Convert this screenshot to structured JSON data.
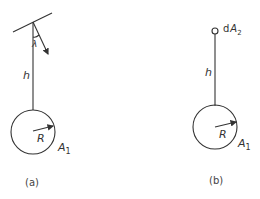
{
  "figure": {
    "panel_a": {
      "caption": "(a)",
      "height_label": "h",
      "angle_label": "λ",
      "radius_label": "R",
      "area_label": "A",
      "area_subscript": "1"
    },
    "panel_b": {
      "caption": "(b)",
      "height_label": "h",
      "radius_label": "R",
      "area_label": "A",
      "area_subscript": "1",
      "element_label_prefix": "d",
      "element_label": "A",
      "element_subscript": "2"
    }
  },
  "colors": {
    "line": "#333333",
    "background": "#ffffff"
  }
}
